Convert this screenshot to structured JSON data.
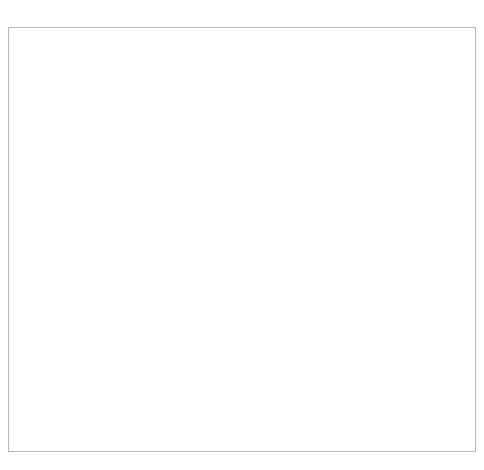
{
  "chart_data": {
    "type": "line",
    "title": "",
    "subtitle": "",
    "xlabel": "",
    "ylabel": "",
    "ylim": [
      0.0,
      1.4
    ],
    "ytick_values": [
      0.0,
      0.2,
      0.4,
      0.6,
      0.8,
      1.0,
      1.2,
      1.4
    ],
    "ytick_labels": [
      "0.0%",
      "0.2%",
      "0.4%",
      "0.6%",
      "0.8%",
      "1.0%",
      "1.2%",
      "1.4%"
    ],
    "grid": true,
    "legend": "none",
    "xlim": [
      1947,
      2013
    ],
    "xtick_labels": [
      "1947年",
      "1950年",
      "1953年",
      "1956年",
      "1959年",
      "1962年",
      "1965年",
      "1968年",
      "1971年",
      "1974年",
      "1977年",
      "1980年",
      "1983年",
      "1986年",
      "1989年",
      "1992年",
      "1995年",
      "1998年",
      "2001年",
      "2004年",
      "2007年",
      "2010年",
      "2013年"
    ],
    "xtick_interval_years": 3,
    "minor_ticks_every_year": true,
    "x": [
      1947,
      1948,
      1949,
      1950,
      1951,
      1952,
      1953,
      1954,
      1955,
      1956,
      1957,
      1958,
      1959,
      1960,
      1961,
      1962,
      1963,
      1964,
      1965,
      1966,
      1967,
      1968,
      1969,
      1970,
      1971,
      1972,
      1973,
      1974,
      1975,
      1976,
      1977,
      1978,
      1979,
      1980,
      1981,
      1982,
      1983,
      1984,
      1985,
      1986,
      1987,
      1988,
      1989,
      1990,
      1991,
      1992,
      1993,
      1994,
      1995,
      1996,
      1997,
      1998,
      1999,
      2000,
      2001,
      2002,
      2003,
      2004,
      2005,
      2006,
      2007,
      2008,
      2009,
      2010,
      2011,
      2012,
      2013
    ],
    "values": [
      1.2,
      1.2,
      1.07,
      0.93,
      0.79,
      0.79,
      0.78,
      0.79,
      0.79,
      0.79,
      0.86,
      0.9,
      0.91,
      0.93,
      0.95,
      0.98,
      0.97,
      0.99,
      0.96,
      0.95,
      0.96,
      0.95,
      0.97,
      1.01,
      1.05,
      1.04,
      1.01,
      0.95,
      0.86,
      0.78,
      0.72,
      0.68,
      0.67,
      0.66,
      0.66,
      0.66,
      0.65,
      0.63,
      0.61,
      0.58,
      0.58,
      0.59,
      0.6,
      0.61,
      0.62,
      0.64,
      0.64,
      0.63,
      0.64,
      0.63,
      0.62,
      0.63,
      0.62,
      0.64,
      0.64,
      0.62,
      0.6,
      0.59,
      0.58,
      0.58,
      0.59,
      0.59,
      0.57,
      0.55,
      0.54,
      0.54,
      0.53
    ],
    "series_name": "",
    "series_color": "#000000",
    "endpoint_marker": true,
    "annotation": {
      "line1": "2013年,",
      "line2": "0.53%",
      "x_value": 2013,
      "y_value": 0.53
    }
  }
}
